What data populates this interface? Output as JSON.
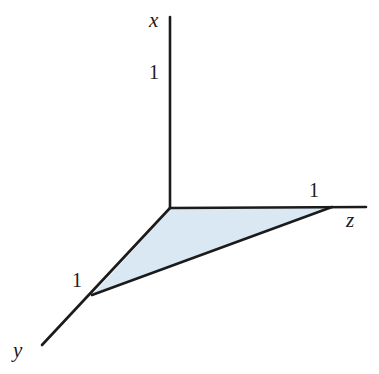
{
  "figure": {
    "kind": "3d-coordinate-axes-with-shaded-triangle",
    "background_color": "#ffffff",
    "line_color": "#1b1b1b",
    "line_width": 2.6,
    "fill_color": "#d9e8f3",
    "fill_stroke_color": "#1b1b1b"
  },
  "axes": {
    "origin": {
      "x": 170,
      "y": 208
    },
    "x": {
      "label": "x",
      "label_position": {
        "x": 149,
        "y": 10
      },
      "line": {
        "x1": 170,
        "y1": 17,
        "x2": 170,
        "y2": 208
      },
      "tick": {
        "label": "1",
        "position": {
          "x": 149,
          "y": 62
        }
      }
    },
    "y": {
      "label": "y",
      "label_position": {
        "x": 13,
        "y": 340
      },
      "line": {
        "x1": 170,
        "y1": 208,
        "x2": 42,
        "y2": 345
      },
      "tick": {
        "label": "1",
        "position": {
          "x": 72,
          "y": 270
        }
      }
    },
    "z": {
      "label": "z",
      "label_position": {
        "x": 346,
        "y": 210
      },
      "line": {
        "x1": 170,
        "y1": 208,
        "x2": 366,
        "y2": 207
      },
      "tick": {
        "label": "1",
        "position": {
          "x": 309,
          "y": 180
        }
      }
    }
  },
  "shaded_region": {
    "name": "unit-triangle-in-yz-plane",
    "vertices": [
      {
        "name": "origin",
        "x": 171,
        "y": 209
      },
      {
        "name": "z-unit",
        "x": 332,
        "y": 207
      },
      {
        "name": "y-unit",
        "x": 92,
        "y": 295
      }
    ],
    "fill": "#d9e8f3"
  }
}
